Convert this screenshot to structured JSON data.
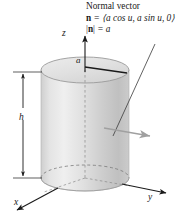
{
  "figure": {
    "name": "cylinder-normal-vector-diagram",
    "background": "#ffffff"
  },
  "annotation": {
    "title": "Normal vector",
    "vector_definition_lhs": "n",
    "vector_definition_rhs": " = ⟨a cos u, a sin u, 0⟩",
    "magnitude_lhs": "|n|",
    "magnitude_rhs": " = a",
    "magnitude_bar_left": "|",
    "magnitude_bar_right": "|"
  },
  "labels": {
    "axis_z": "z",
    "axis_y": "y",
    "axis_x": "x",
    "radius": "a",
    "height": "h"
  },
  "colors": {
    "ink": "#1a1a1a",
    "cylinder_light": "#e9e9e9",
    "cylinder_mid": "#d2d2d2",
    "cylinder_dark": "#b9b9b9",
    "top_face": "#e2e2e2",
    "normal_arrow": "#9a9a9a",
    "leader_line": "#3a3a3a",
    "dashed": "#6e6e6e"
  },
  "geometry": {
    "cylinder_center_x": 85,
    "cylinder_top_y": 70,
    "cylinder_bottom_y": 178,
    "radius_x": 44,
    "radius_y": 13,
    "height_label_value": "h",
    "radius_label_value": "a"
  }
}
